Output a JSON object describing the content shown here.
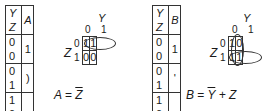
{
  "panels": [
    {
      "id": "A",
      "truth_table": {
        "headers": [
          "Y Z",
          "A"
        ],
        "rows": [
          {
            "inputs": "0 0",
            "output": "1"
          },
          {
            "inputs": "0 1",
            "output": ")"
          },
          {
            "inputs": "1 0",
            "output": ""
          },
          {
            "inputs": "1 1",
            "output": ""
          }
        ]
      },
      "kmap": {
        "col_var": "Y",
        "row_var": "Z",
        "col_labels": [
          "0",
          "1"
        ],
        "row_labels": [
          "0",
          "1"
        ],
        "cells": [
          [
            "1",
            "1"
          ],
          [
            "0",
            "0"
          ]
        ],
        "groups": [
          "row Z=0 horizontal pair"
        ]
      },
      "expression": {
        "lhs": "A",
        "eq": "=",
        "rhs_bar": "Z",
        "rhs_rest": ""
      }
    },
    {
      "id": "B",
      "truth_table": {
        "headers": [
          "Y Z",
          "B"
        ],
        "rows": [
          {
            "inputs": "0 0",
            "output": "1"
          },
          {
            "inputs": "0 1",
            "output": "'"
          },
          {
            "inputs": "1 0",
            "output": ""
          },
          {
            "inputs": "1 1",
            "output": ""
          }
        ]
      },
      "kmap": {
        "col_var": "Y",
        "row_var": "Z",
        "col_labels": [
          "0",
          "1"
        ],
        "row_labels": [
          "0",
          "1"
        ],
        "cells": [
          [
            "1",
            "0"
          ],
          [
            "1",
            "1"
          ]
        ],
        "groups": [
          "column Y=0 vertical pair",
          "row Z=1 horizontal pair"
        ]
      },
      "expression": {
        "lhs": "B",
        "eq": "=",
        "rhs_bar": "Y",
        "rhs_rest": " + Z"
      }
    }
  ]
}
